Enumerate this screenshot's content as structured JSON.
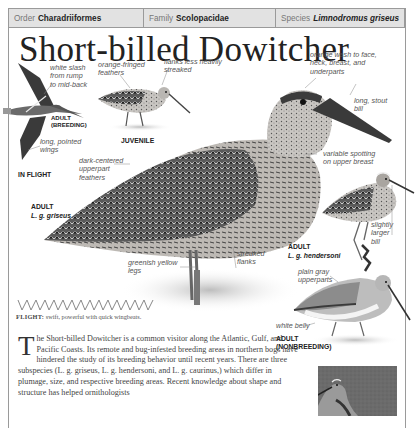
{
  "header": {
    "order_label": "Order",
    "order_value": "Charadriiformes",
    "family_label": "Family",
    "family_value": "Scolopacidae",
    "species_label": "Species",
    "species_value": "Limnodromus griseus"
  },
  "title": "Short-billed Dowitcher",
  "annotations": {
    "white_slash": "white slash\nfrom rump\nto mid-back",
    "long_pointed_wings": "long, pointed\nwings",
    "orange_fringed": "orange-fringed\nfeathers",
    "flanks_less_streaked": "flanks less heavily\nstreaked",
    "orange_wash": "orange wash to face,\nneck, breast, and\nunderparts",
    "long_stout_bill": "long, stout\nbill",
    "dark_centered": "dark-centered\nupperpart\nfeathers",
    "variable_spotting": "variable spotting\non upper breast",
    "slightly_larger_bill": "slightly\nlarger\nbill",
    "greenish_legs": "greenish yellow\nlegs",
    "streaked_flanks": "streaked\nflanks",
    "plain_gray": "plain gray\nupperparts",
    "white_belly": "white belly"
  },
  "labels": {
    "adult_breeding": "ADULT\n(BREEDING)",
    "in_flight": "IN FLIGHT",
    "juvenile": "JUVENILE",
    "adult_griseus": "ADULT",
    "adult_griseus_sub": "L. g. griseus",
    "adult_hendersoni": "ADULT",
    "adult_hendersoni_sub": "L. g. hendersoni",
    "adult_nonbreeding": "ADULT\n(NONBREEDING)"
  },
  "flight": {
    "label": "FLIGHT:",
    "text": " swift, powerful with quick wingbeats."
  },
  "body": {
    "dropcap": "T",
    "text": "he Short-billed Dowitcher is a common visitor along the Atlantic, Gulf, and Pacific Coasts. Its remote and bug-infested breeding areas in northern bogs have hindered the study of its breeding behavior until recent years. There are three subspecies (L. g. griseus, L. g. hendersoni, and L. g. caurinus,) which differ in plumage, size, and respective breeding areas. Recent knowledge about shape and structure has helped ornithologists"
  },
  "colors": {
    "header_bg": "#e2e2e2",
    "border": "#9a9a9a",
    "text_dark": "#222222",
    "annotation": "#555555"
  }
}
